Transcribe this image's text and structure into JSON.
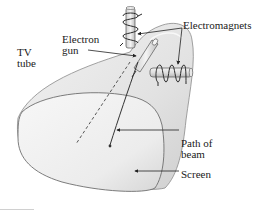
{
  "diagram": {
    "labels": {
      "tv_tube": [
        "TV",
        "tube"
      ],
      "electron_gun": [
        "Electron",
        "gun"
      ],
      "electromagnets": "Electromagnets",
      "path_of_beam": [
        "Path of",
        "beam"
      ],
      "screen": "Screen"
    },
    "colors": {
      "tube_fill": "#e6e6e6",
      "screen_fill": "#ededed",
      "outline": "#7a7a7a",
      "coil": "#2a2a2a",
      "leader": "#222222",
      "beam": "#333333",
      "undeflected_path": "#444444",
      "text": "#1a1a1a"
    },
    "elements": [
      {
        "name": "tv-tube",
        "shape": "funnel body"
      },
      {
        "name": "screen",
        "shape": "rounded rectangle face"
      },
      {
        "name": "electron-gun",
        "shape": "cylinder in neck"
      },
      {
        "name": "vertical-electromagnet",
        "shape": "coil around vertical rod"
      },
      {
        "name": "horizontal-electromagnet",
        "shape": "coil around horizontal rod"
      },
      {
        "name": "deflected-beam",
        "shape": "curved solid line ending at dot"
      },
      {
        "name": "undeflected-path",
        "shape": "straight dashed line"
      }
    ]
  }
}
